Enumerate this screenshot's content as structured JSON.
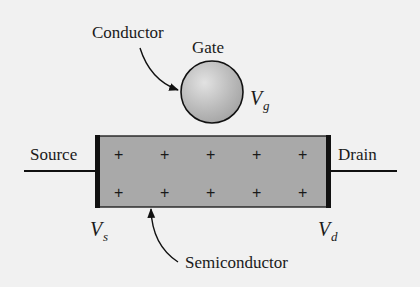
{
  "labels": {
    "conductor": "Conductor",
    "gate": "Gate",
    "source": "Source",
    "drain": "Drain",
    "semiconductor": "Semiconductor"
  },
  "voltages": {
    "gate": {
      "symbol": "V",
      "subscript": "g"
    },
    "source": {
      "symbol": "V",
      "subscript": "s"
    },
    "drain": {
      "symbol": "V",
      "subscript": "d"
    }
  },
  "charges": {
    "symbol": "+",
    "rows": 2,
    "columns": 5
  },
  "colors": {
    "background": "#f1f1f1",
    "semiconductor_fill": "#a9a9a9",
    "gate_fill": "#bdbdbd",
    "stroke": "#111111"
  }
}
